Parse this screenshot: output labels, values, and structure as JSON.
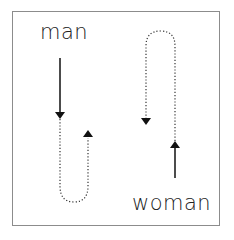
{
  "diagram": {
    "labels": {
      "man": "man",
      "woman": "woman"
    },
    "colors": {
      "border": "#8c8c8c",
      "stroke": "#111111",
      "text": "#222222",
      "background": "#ffffff"
    },
    "paths": [
      {
        "id": "man-solid",
        "style": "solid",
        "direction": "down",
        "description": "man's straight downward arrow"
      },
      {
        "id": "man-dotted-u",
        "style": "dotted",
        "direction": "down-then-up",
        "description": "U-shaped dotted return path ending with upward arrowhead"
      },
      {
        "id": "woman-dotted-n",
        "style": "dotted",
        "direction": "up-then-down",
        "description": "inverted U dotted path ending with downward arrowhead"
      },
      {
        "id": "woman-solid",
        "style": "solid",
        "direction": "up",
        "description": "woman's straight upward arrow"
      }
    ]
  }
}
